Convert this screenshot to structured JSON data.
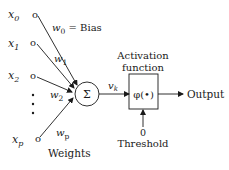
{
  "diagram": {
    "type": "perceptron-neuron-model",
    "inputs": [
      {
        "var": "x",
        "sub": "0",
        "weight_var": "w",
        "weight_sub": "0",
        "weight_extra": " = Bias"
      },
      {
        "var": "x",
        "sub": "1",
        "weight_var": "w",
        "weight_sub": "1",
        "weight_extra": ""
      },
      {
        "var": "x",
        "sub": "2",
        "weight_var": "w",
        "weight_sub": "2",
        "weight_extra": ""
      },
      {
        "var": "x",
        "sub": "p",
        "weight_var": "w",
        "weight_sub": "p",
        "weight_extra": ""
      }
    ],
    "input_node_symbol": "o",
    "ellipsis": "⋮",
    "weights_label": "Weights",
    "summation_symbol": "Σ",
    "induced_field": {
      "var": "v",
      "sub": "k"
    },
    "activation": {
      "title_line1": "Activation",
      "title_line2": "function",
      "symbol": "φ(•)"
    },
    "output_label": "Output",
    "threshold": {
      "value": "0",
      "label": "Threshold"
    },
    "colors": {
      "stroke": "#1a1a1a",
      "background": "#ffffff"
    }
  }
}
